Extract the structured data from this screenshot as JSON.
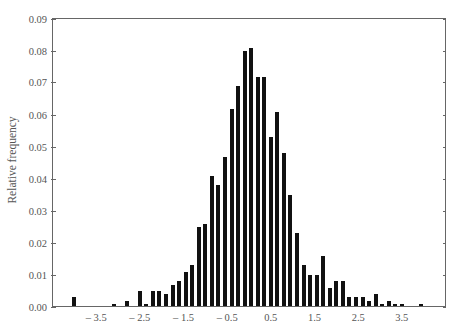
{
  "chart_data": {
    "type": "bar",
    "title": "",
    "xlabel": "",
    "ylabel": "Relative frequency",
    "xlim": [
      -4.5,
      4.5
    ],
    "ylim": [
      0,
      0.09
    ],
    "grid": false,
    "legend": null,
    "bar_color": "#111111",
    "axis_color": "#666666",
    "text_color": "#555555",
    "x_ticks": [
      {
        "value": -3.5,
        "label": "– 3.5"
      },
      {
        "value": -2.5,
        "label": "– 2.5"
      },
      {
        "value": -1.5,
        "label": "– 1.5"
      },
      {
        "value": -0.5,
        "label": "– 0.5"
      },
      {
        "value": 0.5,
        "label": "0.5"
      },
      {
        "value": 1.5,
        "label": "1.5"
      },
      {
        "value": 2.5,
        "label": "2.5"
      },
      {
        "value": 3.5,
        "label": "3.5"
      }
    ],
    "y_ticks": [
      {
        "value": 0.0,
        "label": "0.00"
      },
      {
        "value": 0.01,
        "label": "0.01"
      },
      {
        "value": 0.02,
        "label": "0.02"
      },
      {
        "value": 0.03,
        "label": "0.03"
      },
      {
        "value": 0.04,
        "label": "0.04"
      },
      {
        "value": 0.05,
        "label": "0.05"
      },
      {
        "value": 0.06,
        "label": "0.06"
      },
      {
        "value": 0.07,
        "label": "0.07"
      },
      {
        "value": 0.08,
        "label": "0.08"
      },
      {
        "value": 0.09,
        "label": "0.09"
      }
    ],
    "x": [
      -4.0,
      -3.85,
      -3.7,
      -3.55,
      -3.4,
      -3.25,
      -3.1,
      -2.95,
      -2.8,
      -2.65,
      -2.5,
      -2.35,
      -2.2,
      -2.05,
      -1.9,
      -1.75,
      -1.6,
      -1.45,
      -1.3,
      -1.15,
      -1.0,
      -0.85,
      -0.7,
      -0.55,
      -0.4,
      -0.25,
      -0.1,
      0.05,
      0.2,
      0.35,
      0.5,
      0.65,
      0.8,
      0.95,
      1.1,
      1.25,
      1.4,
      1.55,
      1.7,
      1.85,
      2.0,
      2.15,
      2.3,
      2.45,
      2.6,
      2.75,
      2.9,
      3.05,
      3.2,
      3.35,
      3.5,
      3.65,
      3.8,
      3.95,
      4.1,
      4.25,
      4.4
    ],
    "values": [
      0.003,
      0,
      0,
      0,
      0,
      0,
      0.001,
      0,
      0.002,
      0,
      0.005,
      0.001,
      0.005,
      0.005,
      0.004,
      0.007,
      0.008,
      0.011,
      0.013,
      0.025,
      0.026,
      0.041,
      0.038,
      0.047,
      0.062,
      0.069,
      0.08,
      0.081,
      0.072,
      0.072,
      0.053,
      0.061,
      0.048,
      0.035,
      0.023,
      0.013,
      0.01,
      0.01,
      0.016,
      0.006,
      0.008,
      0.008,
      0.003,
      0.003,
      0.003,
      0.002,
      0.004,
      0.001,
      0.002,
      0.001,
      0.001,
      0,
      0,
      0.001,
      0,
      0,
      0
    ]
  }
}
